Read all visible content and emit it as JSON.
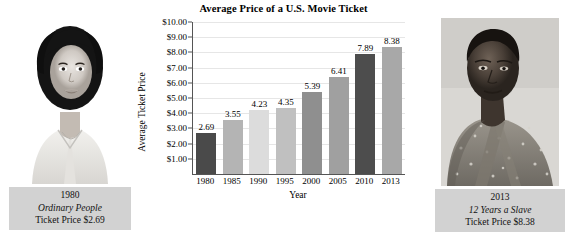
{
  "chart_data": {
    "type": "bar",
    "title": "Average Price of a U.S. Movie Ticket",
    "xlabel": "Year",
    "ylabel": "Average Ticket Price",
    "categories": [
      "1980",
      "1985",
      "1990",
      "1995",
      "2000",
      "2005",
      "2010",
      "2013"
    ],
    "values": [
      2.69,
      3.55,
      4.23,
      4.35,
      5.39,
      6.41,
      7.89,
      8.38
    ],
    "value_labels": [
      "2.69",
      "3.55",
      "4.23",
      "4.35",
      "5.39",
      "6.41",
      "7.89",
      "8.38"
    ],
    "bar_colors": [
      "#4a4a4a",
      "#b4b4b4",
      "#dcdcdc",
      "#c0c0c0",
      "#8f8f8f",
      "#a0a0a0",
      "#4d4d4d",
      "#a8a8a8"
    ],
    "ylim": [
      0,
      10
    ],
    "ytick_values": [
      1,
      2,
      3,
      4,
      5,
      6,
      7,
      8,
      9,
      10
    ],
    "ytick_labels": [
      "$1.00",
      "$2.00",
      "$3.00",
      "$4.00",
      "$5.00",
      "$6.00",
      "$7.00",
      "$8.00",
      "$9.00",
      "$10.00"
    ],
    "grid": true,
    "legend": "none"
  },
  "left_photo": {
    "image_name": "portrait-ordinary-people",
    "caption_year": "1980",
    "caption_film": "Ordinary People",
    "caption_price": "Ticket Price $2.69"
  },
  "right_photo": {
    "image_name": "portrait-12-years-a-slave",
    "caption_year": "2013",
    "caption_film": "12 Years a Slave",
    "caption_price": "Ticket Price $8.38"
  }
}
